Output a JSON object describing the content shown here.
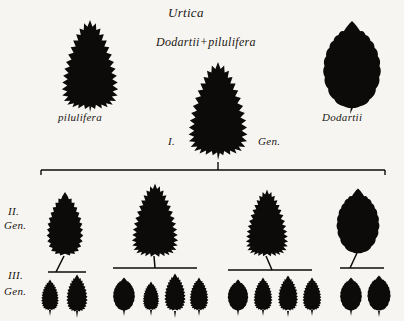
{
  "figure": {
    "title": "Urtica",
    "cross": "Dodartii+pilulifera",
    "background_color": "#f7f5f1",
    "ink_color": "#0d0b09"
  },
  "parents": {
    "left": {
      "name": "pilulifera",
      "margin": "deeply-serrate-spiky",
      "outline": "triangular"
    },
    "right": {
      "name": "Dodartii",
      "margin": "smooth-crenate",
      "outline": "ovate"
    }
  },
  "generations": {
    "f1": {
      "numeral": "I.",
      "suffix": "Gen.",
      "count": 1,
      "leaves": [
        {
          "margin": "deeply-serrate-spiky",
          "outline": "triangular"
        }
      ]
    },
    "f2": {
      "numeral": "II.",
      "suffix": "Gen.",
      "count": 4,
      "leaves": [
        {
          "margin": "serrate",
          "outline": "broad-ovate"
        },
        {
          "margin": "deeply-serrate-spiky",
          "outline": "triangular"
        },
        {
          "margin": "deeply-serrate-spiky",
          "outline": "triangular"
        },
        {
          "margin": "smooth-crenate",
          "outline": "ovate"
        }
      ]
    },
    "f3": {
      "numeral": "III.",
      "suffix": "Gen.",
      "groups": [
        {
          "count": 2,
          "leaves": [
            {
              "margin": "serrate",
              "outline": "ovate"
            },
            {
              "margin": "serrate",
              "outline": "ovate"
            }
          ]
        },
        {
          "count": 4,
          "leaves": [
            {
              "margin": "smooth-crenate",
              "outline": "ovate"
            },
            {
              "margin": "serrate",
              "outline": "ovate"
            },
            {
              "margin": "serrate",
              "outline": "ovate"
            },
            {
              "margin": "serrate",
              "outline": "ovate"
            }
          ]
        },
        {
          "count": 4,
          "leaves": [
            {
              "margin": "smooth-crenate",
              "outline": "ovate"
            },
            {
              "margin": "serrate",
              "outline": "ovate"
            },
            {
              "margin": "serrate",
              "outline": "ovate"
            },
            {
              "margin": "serrate",
              "outline": "ovate"
            }
          ]
        },
        {
          "count": 2,
          "leaves": [
            {
              "margin": "smooth-crenate",
              "outline": "ovate"
            },
            {
              "margin": "smooth-crenate",
              "outline": "ovate"
            }
          ]
        }
      ]
    }
  }
}
